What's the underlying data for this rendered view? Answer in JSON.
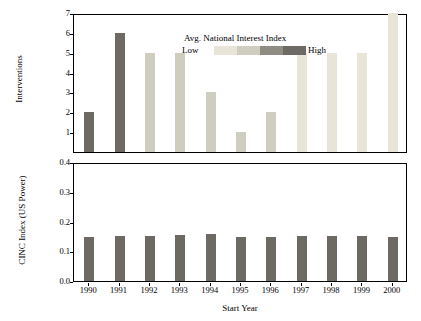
{
  "chart_data": {
    "type": "bar",
    "title": "",
    "xlabel": "Start Year",
    "legend": {
      "title": "Avg. National Interest Index",
      "low_label": "Low",
      "high_label": "High",
      "swatches": [
        "#e8e5d8",
        "#cfccc0",
        "#8f8c84",
        "#6d6a64"
      ],
      "position": "top-left-inside"
    },
    "categories": [
      "1990",
      "1991",
      "1992",
      "1993",
      "1994",
      "1995",
      "1996",
      "1997",
      "1998",
      "1999",
      "2000"
    ],
    "panels": [
      {
        "name": "interventions",
        "ylabel": "Interventions",
        "ylim": [
          0,
          7
        ],
        "yticks": [
          "1",
          "2",
          "3",
          "4",
          "5",
          "6",
          "7"
        ],
        "ytick_values": [
          1,
          2,
          3,
          4,
          5,
          6,
          7
        ],
        "values": [
          2,
          6,
          5,
          5,
          3,
          1,
          2,
          5,
          5,
          5,
          7
        ],
        "bar_colors": [
          "#6d6a64",
          "#6d6a64",
          "#cfccc0",
          "#cfccc0",
          "#cfccc0",
          "#cfccc0",
          "#cfccc0",
          "#e8e5d8",
          "#e8e5d8",
          "#e8e5d8",
          "#e8e5d8"
        ]
      },
      {
        "name": "cinc-index",
        "ylabel": "CINC Index (US Power)",
        "ylim": [
          0.0,
          0.4
        ],
        "yticks": [
          "0.0",
          "0.1",
          "0.2",
          "0.3",
          "0.4"
        ],
        "ytick_values": [
          0.0,
          0.1,
          0.2,
          0.3,
          0.4
        ],
        "values": [
          0.148,
          0.152,
          0.152,
          0.154,
          0.157,
          0.147,
          0.148,
          0.151,
          0.151,
          0.151,
          0.148
        ],
        "bar_colors": [
          "#6d6a64",
          "#6d6a64",
          "#6d6a64",
          "#6d6a64",
          "#6d6a64",
          "#6d6a64",
          "#6d6a64",
          "#6d6a64",
          "#6d6a64",
          "#6d6a64",
          "#6d6a64"
        ]
      }
    ]
  }
}
